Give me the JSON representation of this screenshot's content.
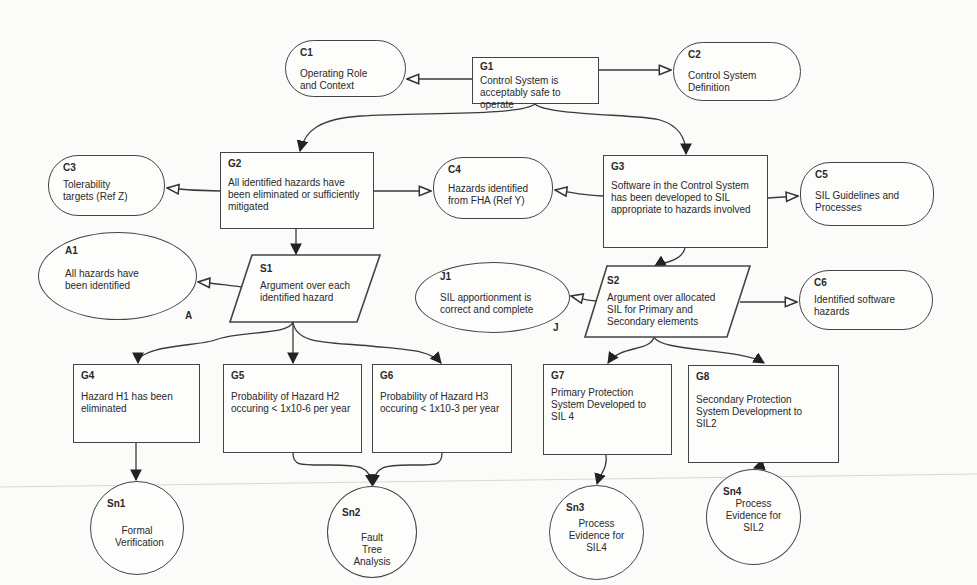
{
  "diagram": {
    "type": "Goal Structuring Notation (GSN) safety case",
    "nodes": {
      "G1": {
        "id": "G1",
        "kind": "goal",
        "text": "Control System is acceptably safe to operate"
      },
      "C1": {
        "id": "C1",
        "kind": "context",
        "text": "Operating Role and Context"
      },
      "C2": {
        "id": "C2",
        "kind": "context",
        "text": "Control System Definition"
      },
      "G2": {
        "id": "G2",
        "kind": "goal",
        "text": "All identified hazards have been eliminated or sufficiently mitigated"
      },
      "C3": {
        "id": "C3",
        "kind": "context",
        "text": "Tolerability targets (Ref Z)"
      },
      "C4": {
        "id": "C4",
        "kind": "context",
        "text": "Hazards identified from FHA (Ref Y)"
      },
      "G3": {
        "id": "G3",
        "kind": "goal",
        "text": "Software in the Control System has been developed to SIL appropriate to hazards involved"
      },
      "C5": {
        "id": "C5",
        "kind": "context",
        "text": "SIL Guidelines and Processes"
      },
      "A1": {
        "id": "A1",
        "kind": "assumption",
        "text": "All hazards have been identified",
        "marker": "A"
      },
      "S1": {
        "id": "S1",
        "kind": "strategy",
        "text": "Argument over each identified hazard"
      },
      "J1": {
        "id": "J1",
        "kind": "justification",
        "text": "SIL apportionment is correct and complete",
        "marker": "J"
      },
      "S2": {
        "id": "S2",
        "kind": "strategy",
        "text": "Argument over allocated SIL for Primary and Secondary elements"
      },
      "C6": {
        "id": "C6",
        "kind": "context",
        "text": "Identified software hazards"
      },
      "G4": {
        "id": "G4",
        "kind": "goal",
        "text": "Hazard H1 has been eliminated"
      },
      "G5": {
        "id": "G5",
        "kind": "goal",
        "text": "Probability of Hazard H2 occuring < 1x10-6 per year"
      },
      "G6": {
        "id": "G6",
        "kind": "goal",
        "text": "Probability of Hazard H3 occuring < 1x10-3 per year"
      },
      "G7": {
        "id": "G7",
        "kind": "goal",
        "text": "Primary Protection System Developed to SIL 4"
      },
      "G8": {
        "id": "G8",
        "kind": "goal",
        "text": "Secondary Protection System Development to SIL2"
      },
      "Sn1": {
        "id": "Sn1",
        "kind": "solution",
        "text": "Formal Verification"
      },
      "Sn2": {
        "id": "Sn2",
        "kind": "solution",
        "text": "Fault Tree Analysis"
      },
      "Sn3": {
        "id": "Sn3",
        "kind": "solution",
        "text": "Process Evidence for SIL4"
      },
      "Sn4": {
        "id": "Sn4",
        "kind": "solution",
        "text": "Process Evidence for SIL2"
      }
    },
    "edges": [
      {
        "from": "G1",
        "to": "C1",
        "type": "in-context-of"
      },
      {
        "from": "G1",
        "to": "C2",
        "type": "in-context-of"
      },
      {
        "from": "G1",
        "to": "G2",
        "type": "supported-by"
      },
      {
        "from": "G1",
        "to": "G3",
        "type": "supported-by"
      },
      {
        "from": "G2",
        "to": "C3",
        "type": "in-context-of"
      },
      {
        "from": "G2",
        "to": "C4",
        "type": "in-context-of"
      },
      {
        "from": "G3",
        "to": "C4",
        "type": "in-context-of"
      },
      {
        "from": "G3",
        "to": "C5",
        "type": "in-context-of"
      },
      {
        "from": "G2",
        "to": "S1",
        "type": "supported-by"
      },
      {
        "from": "S1",
        "to": "A1",
        "type": "in-context-of"
      },
      {
        "from": "G3",
        "to": "S2",
        "type": "supported-by"
      },
      {
        "from": "S2",
        "to": "J1",
        "type": "in-context-of"
      },
      {
        "from": "S2",
        "to": "C6",
        "type": "in-context-of"
      },
      {
        "from": "S1",
        "to": "G4",
        "type": "supported-by"
      },
      {
        "from": "S1",
        "to": "G5",
        "type": "supported-by"
      },
      {
        "from": "S1",
        "to": "G6",
        "type": "supported-by"
      },
      {
        "from": "S2",
        "to": "G7",
        "type": "supported-by"
      },
      {
        "from": "S2",
        "to": "G8",
        "type": "supported-by"
      },
      {
        "from": "G4",
        "to": "Sn1",
        "type": "supported-by"
      },
      {
        "from": "G5",
        "to": "Sn2",
        "type": "supported-by"
      },
      {
        "from": "G6",
        "to": "Sn2",
        "type": "supported-by"
      },
      {
        "from": "G7",
        "to": "Sn3",
        "type": "supported-by"
      },
      {
        "from": "G8",
        "to": "Sn4",
        "type": "supported-by"
      }
    ]
  }
}
